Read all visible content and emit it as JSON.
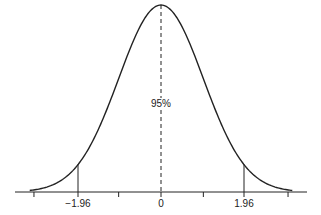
{
  "chart_data": {
    "type": "line",
    "title": "",
    "xlabel": "",
    "ylabel": "",
    "x_range": [
      -3.5,
      3.5
    ],
    "tick_positions": [
      -3,
      -1.96,
      -1,
      0,
      1,
      1.96,
      3
    ],
    "tick_labels": [
      {
        "x": -1.96,
        "label": "−1.96"
      },
      {
        "x": 0,
        "label": "0"
      },
      {
        "x": 1.96,
        "label": "1.96"
      }
    ],
    "critical_values": [
      -1.96,
      1.96
    ],
    "center_line": {
      "x": 0,
      "style": "dashed"
    },
    "annotation": {
      "text": "95%",
      "x": 0
    },
    "grid": false,
    "legend": null
  },
  "labels": {
    "neg": "−1.96",
    "zero": "0",
    "pos": "1.96",
    "center": "95%"
  }
}
